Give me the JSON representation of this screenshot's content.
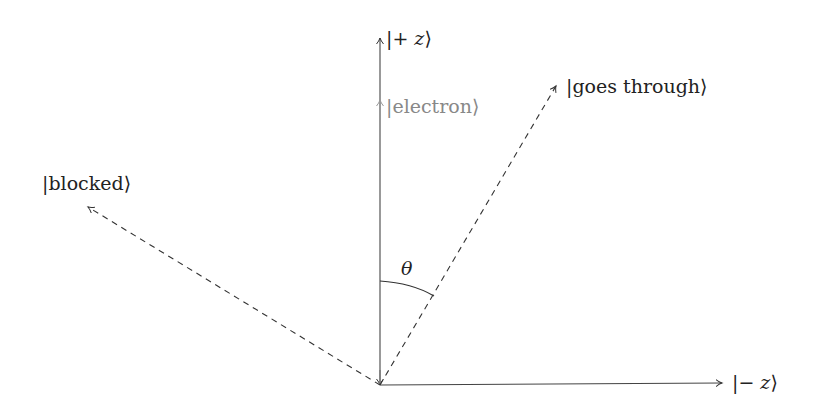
{
  "diagram": {
    "axes": {
      "plus_z": {
        "label": "|+z⟩",
        "ket_inner": "+ z"
      },
      "minus_z": {
        "label": "|−z⟩",
        "ket_inner": "− z"
      }
    },
    "vectors": {
      "electron": {
        "label": "|electron⟩",
        "color": "#888888"
      },
      "goes_through": {
        "label": "|goes through⟩"
      },
      "blocked": {
        "label": "|blocked⟩"
      }
    },
    "angle": {
      "label": "θ"
    }
  }
}
